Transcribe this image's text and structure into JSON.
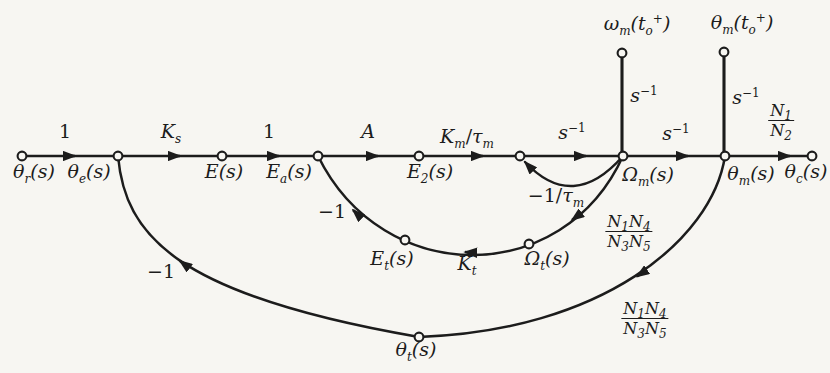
{
  "figure": {
    "type": "signal-flow-graph",
    "colors": {
      "ink": "#1c1c1c",
      "paper": "#f7f6f2"
    },
    "nodes": [
      "θr(s)",
      "θe(s)",
      "E(s)",
      "Ea(s)",
      "E2(s)",
      "(junction)",
      "Ωm(s)",
      "θm(s)",
      "θc(s)",
      "ωm(to+)",
      "θm(to+)",
      "Ωt(s)",
      "Et(s)",
      "θt(s)"
    ],
    "branches": [
      {
        "from": "θr(s)",
        "to": "θe(s)",
        "gain": "1"
      },
      {
        "from": "θe(s)",
        "to": "E(s)",
        "gain": "Ks"
      },
      {
        "from": "E(s)",
        "to": "Ea(s)",
        "gain": "1"
      },
      {
        "from": "Ea(s)",
        "to": "E2(s)",
        "gain": "A"
      },
      {
        "from": "E2(s)",
        "to": "(junction)",
        "gain": "Km/τm"
      },
      {
        "from": "(junction)",
        "to": "Ωm(s)",
        "gain": "s⁻¹"
      },
      {
        "from": "Ωm(s)",
        "to": "(junction)",
        "gain": "−1/τm"
      },
      {
        "from": "Ωm(s)",
        "to": "θm(s)",
        "gain": "s⁻¹"
      },
      {
        "from": "θm(s)",
        "to": "θc(s)",
        "gain": "N1/N2"
      },
      {
        "from": "ωm(to+)",
        "to": "Ωm(s)",
        "gain": "s⁻¹"
      },
      {
        "from": "θm(to+)",
        "to": "θm(s)",
        "gain": "s⁻¹"
      },
      {
        "from": "Ωm(s)",
        "to": "Ωt(s)",
        "gain": "N1N4/N3N5"
      },
      {
        "from": "Ωt(s)",
        "to": "Et(s)",
        "gain": "Kt"
      },
      {
        "from": "Et(s)",
        "to": "Ea(s)",
        "gain": "−1"
      },
      {
        "from": "θm(s)",
        "to": "θt(s)",
        "gain": "N1N4/N3N5"
      },
      {
        "from": "θt(s)",
        "to": "θe(s)",
        "gain": "−1"
      }
    ]
  },
  "labels": {
    "g1_first": [
      [
        "u",
        "1"
      ]
    ],
    "ks": [
      [
        "t",
        "K"
      ],
      [
        "sub",
        "s"
      ]
    ],
    "g1_second": [
      [
        "u",
        "1"
      ]
    ],
    "a_gain": [
      [
        "t",
        "A"
      ]
    ],
    "km_tau": [
      [
        "t",
        "K"
      ],
      [
        "sub",
        "m"
      ],
      [
        "u",
        "/"
      ],
      [
        "t",
        "τ"
      ],
      [
        "sub",
        "m"
      ]
    ],
    "sinv_mid1": [
      [
        "t",
        "s"
      ],
      [
        "sup",
        "−1"
      ]
    ],
    "sinv_mid2": [
      [
        "t",
        "s"
      ],
      [
        "sup",
        "−1"
      ]
    ],
    "sinv_v1": [
      [
        "t",
        "s"
      ],
      [
        "sup",
        "−1"
      ]
    ],
    "sinv_v2": [
      [
        "t",
        "s"
      ],
      [
        "sup",
        "−1"
      ]
    ],
    "minus_tau": [
      [
        "u",
        "−1/"
      ],
      [
        "t",
        "τ"
      ],
      [
        "sub",
        "m"
      ]
    ],
    "kt": [
      [
        "t",
        "K"
      ],
      [
        "sub",
        "t"
      ]
    ],
    "minus_inner": [
      [
        "u",
        "−1"
      ]
    ],
    "minus_outer": [
      [
        "u",
        "−1"
      ]
    ],
    "theta_r": [
      [
        "t",
        "θ"
      ],
      [
        "sub",
        "r"
      ],
      [
        "t",
        "(s)"
      ]
    ],
    "theta_e": [
      [
        "t",
        "θ"
      ],
      [
        "sub",
        "e"
      ],
      [
        "t",
        "(s)"
      ]
    ],
    "e_node": [
      [
        "t",
        "E(s)"
      ]
    ],
    "e_a": [
      [
        "t",
        "E"
      ],
      [
        "sub",
        "a"
      ],
      [
        "t",
        "(s)"
      ]
    ],
    "e_2": [
      [
        "t",
        "E"
      ],
      [
        "sub",
        "2"
      ],
      [
        "t",
        "(s)"
      ]
    ],
    "omega_m": [
      [
        "t",
        "Ω"
      ],
      [
        "sub",
        "m"
      ],
      [
        "t",
        "(s)"
      ]
    ],
    "theta_m": [
      [
        "t",
        "θ"
      ],
      [
        "sub",
        "m"
      ],
      [
        "t",
        "(s)"
      ]
    ],
    "theta_c": [
      [
        "t",
        "θ"
      ],
      [
        "sub",
        "c"
      ],
      [
        "t",
        "(s)"
      ]
    ],
    "omega_ic": [
      [
        "t",
        "ω"
      ],
      [
        "sub",
        "m"
      ],
      [
        "t",
        "("
      ],
      [
        "t",
        "t"
      ],
      [
        "sub",
        "o"
      ],
      [
        "sup",
        "+"
      ],
      [
        "t",
        ")"
      ]
    ],
    "theta_ic": [
      [
        "t",
        "θ"
      ],
      [
        "sub",
        "m"
      ],
      [
        "t",
        "("
      ],
      [
        "t",
        "t"
      ],
      [
        "sub",
        "o"
      ],
      [
        "sup",
        "+"
      ],
      [
        "t",
        ")"
      ]
    ],
    "omega_t": [
      [
        "t",
        "Ω"
      ],
      [
        "sub",
        "t"
      ],
      [
        "t",
        "(s)"
      ]
    ],
    "e_t": [
      [
        "t",
        "E"
      ],
      [
        "sub",
        "t"
      ],
      [
        "t",
        "(s)"
      ]
    ],
    "theta_t": [
      [
        "t",
        "θ"
      ],
      [
        "sub",
        "t"
      ],
      [
        "t",
        "(s)"
      ]
    ],
    "n1n2": {
      "num": [
        [
          "t",
          "N"
        ],
        [
          "sub",
          "1"
        ]
      ],
      "den": [
        [
          "t",
          "N"
        ],
        [
          "sub",
          "2"
        ]
      ]
    },
    "n1n4_upper": {
      "num": [
        [
          "t",
          "N"
        ],
        [
          "sub",
          "1"
        ],
        [
          "t",
          "N"
        ],
        [
          "sub",
          "4"
        ]
      ],
      "den": [
        [
          "t",
          "N"
        ],
        [
          "sub",
          "3"
        ],
        [
          "t",
          "N"
        ],
        [
          "sub",
          "5"
        ]
      ]
    },
    "n1n4_lower": {
      "num": [
        [
          "t",
          "N"
        ],
        [
          "sub",
          "1"
        ],
        [
          "t",
          "N"
        ],
        [
          "sub",
          "4"
        ]
      ],
      "den": [
        [
          "t",
          "N"
        ],
        [
          "sub",
          "3"
        ],
        [
          "t",
          "N"
        ],
        [
          "sub",
          "5"
        ]
      ]
    }
  }
}
